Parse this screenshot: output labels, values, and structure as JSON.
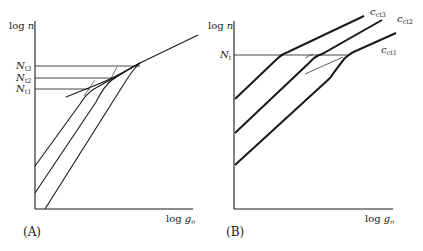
{
  "colors": {
    "ink": "#1a1a1a",
    "background": "#ffffff"
  },
  "panel_a": {
    "panel_label": "(A)",
    "y_axis_label": {
      "prefix": "log ",
      "var": "n"
    },
    "x_axis_label": {
      "prefix": "log ",
      "var": "g",
      "sub": "o"
    },
    "levels": [
      {
        "var": "N",
        "sub": "t3"
      },
      {
        "var": "N",
        "sub": "t2"
      },
      {
        "var": "N",
        "sub": "t1"
      }
    ]
  },
  "panel_b": {
    "panel_label": "(B)",
    "y_axis_label": {
      "prefix": "log ",
      "var": "n"
    },
    "x_axis_label": {
      "prefix": "log ",
      "var": "g",
      "sub": "o"
    },
    "level": {
      "var": "N",
      "sub": "t"
    },
    "curves": [
      {
        "var": "c",
        "sub": "ct3"
      },
      {
        "var": "c",
        "sub": "ct2"
      },
      {
        "var": "c",
        "sub": "ct1"
      }
    ]
  }
}
